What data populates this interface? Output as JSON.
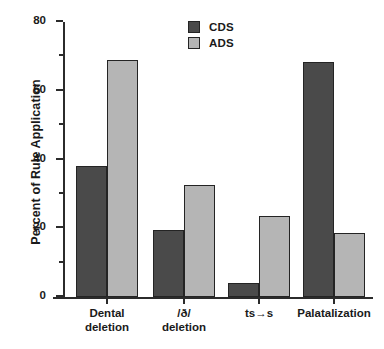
{
  "chart_data": {
    "type": "bar",
    "title": "",
    "xlabel": "",
    "ylabel": "Percent of Rule Application",
    "categories": [
      "Dental\ndeletion",
      "/ð/\ndeletion",
      "ts→s",
      "Palatalization"
    ],
    "series": [
      {
        "name": "CDS",
        "color": "#4a4a4a",
        "values": [
          38,
          19.5,
          4,
          68.5
        ]
      },
      {
        "name": "ADS",
        "color": "#b5b5b5",
        "values": [
          69,
          32.5,
          23.5,
          18.5
        ]
      }
    ],
    "ylim": [
      0,
      80
    ],
    "ytick_labels": [
      "0",
      "20",
      "40",
      "60",
      "80"
    ],
    "ytick_values": [
      0,
      20,
      40,
      60,
      80
    ],
    "yminor_values": [
      10,
      30,
      50,
      70
    ],
    "grid": false,
    "legend_position": "top-center"
  }
}
